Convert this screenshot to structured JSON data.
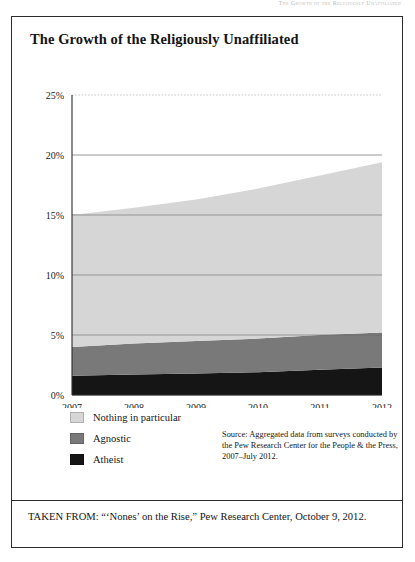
{
  "running_head": "The Growth of the Religiously Unaffiliated",
  "figure": {
    "title": "The Growth of the Religiously Unaffiliated",
    "source_note": "Source: Aggregated data from surveys conducted by the Pew Research Center for the People & the Press, 2007–July 2012.",
    "taken_from": "TAKEN FROM: “‘Nones’ on the Rise,” Pew Research Center, October 9, 2012."
  },
  "legend": {
    "items": [
      {
        "label": "Nothing in particular",
        "color": "#d6d6d6"
      },
      {
        "label": "Agnostic",
        "color": "#797979"
      },
      {
        "label": "Atheist",
        "color": "#151515"
      }
    ]
  },
  "chart_data": {
    "type": "area",
    "stacked": true,
    "title": "The Growth of the Religiously Unaffiliated",
    "xlabel": "",
    "ylabel": "",
    "x": [
      2007,
      2008,
      2009,
      2010,
      2011,
      2012
    ],
    "xtick_labels": [
      "2007",
      "2008",
      "2009",
      "2010",
      "2011",
      "2012"
    ],
    "ytick_labels": [
      "0%",
      "5%",
      "10%",
      "15%",
      "20%",
      "25%"
    ],
    "ytick_values": [
      0,
      5,
      10,
      15,
      20,
      25
    ],
    "ylim": [
      0,
      25
    ],
    "xlim": [
      2007,
      2012
    ],
    "grid": true,
    "legend_position": "below-left",
    "series": [
      {
        "name": "Atheist",
        "color": "#151515",
        "values": [
          1.6,
          1.7,
          1.8,
          1.9,
          2.1,
          2.3
        ]
      },
      {
        "name": "Agnostic",
        "color": "#797979",
        "values": [
          2.4,
          2.6,
          2.7,
          2.8,
          2.9,
          2.9
        ]
      },
      {
        "name": "Nothing in particular",
        "color": "#d6d6d6",
        "values": [
          11.0,
          11.3,
          11.8,
          12.5,
          13.3,
          14.2
        ]
      }
    ],
    "totals": [
      15.0,
      15.6,
      16.3,
      17.2,
      18.3,
      19.4
    ]
  }
}
